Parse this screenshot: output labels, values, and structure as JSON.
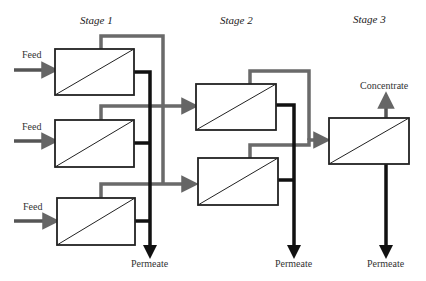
{
  "diagram": {
    "type": "three-stage membrane cascade",
    "stages": [
      {
        "label": "Stage 1",
        "modules": 3
      },
      {
        "label": "Stage 2",
        "modules": 2
      },
      {
        "label": "Stage 3",
        "modules": 1
      }
    ],
    "labels": {
      "feed": "Feed",
      "permeate": "Permeate",
      "concentrate": "Concentrate"
    },
    "colors": {
      "concentrate_line": "#666666",
      "permeate_line": "#111111",
      "box_border": "#222222"
    }
  }
}
